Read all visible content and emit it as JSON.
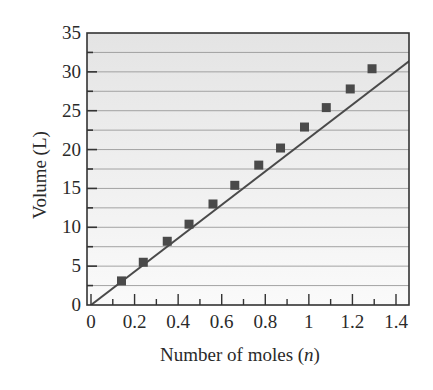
{
  "chart_data": {
    "type": "scatter",
    "title": "",
    "xlabel": "Number of moles (n)",
    "xlabel_parts": [
      "Number of moles (",
      "n",
      ")"
    ],
    "ylabel": "Volume (L)",
    "xlim": [
      0,
      1.4
    ],
    "ylim": [
      0,
      35
    ],
    "x_ticks": [
      0,
      0.2,
      0.4,
      0.6,
      0.8,
      1,
      1.2,
      1.4
    ],
    "x_tick_labels": [
      "0",
      "0.2",
      "0.4",
      "0.6",
      "0.8",
      "1",
      "1.2",
      "1.4"
    ],
    "y_ticks": [
      0,
      5,
      10,
      15,
      20,
      25,
      30,
      35
    ],
    "y_tick_labels": [
      "0",
      "5",
      "10",
      "15",
      "20",
      "25",
      "30",
      "35"
    ],
    "grid": "horizontal every 2.5 L",
    "legend": null,
    "series": [
      {
        "name": "Measured volume",
        "marker": "square",
        "x": [
          0.14,
          0.24,
          0.35,
          0.45,
          0.56,
          0.66,
          0.77,
          0.87,
          0.98,
          1.08,
          1.19,
          1.29
        ],
        "y": [
          3.1,
          5.5,
          8.2,
          10.4,
          13.0,
          15.4,
          18.0,
          20.2,
          22.9,
          25.4,
          27.8,
          30.4
        ]
      },
      {
        "name": "Linear fit",
        "type": "line",
        "x": [
          0,
          1.4
        ],
        "y": [
          0,
          31.4
        ]
      }
    ],
    "colors": {
      "background_top": "#e4e4e4",
      "background_bottom": "#fafafa",
      "gridline": "#9a9a9a",
      "axis": "#333333",
      "line": "#4a4a4a",
      "marker": "#4a4a4a"
    }
  }
}
